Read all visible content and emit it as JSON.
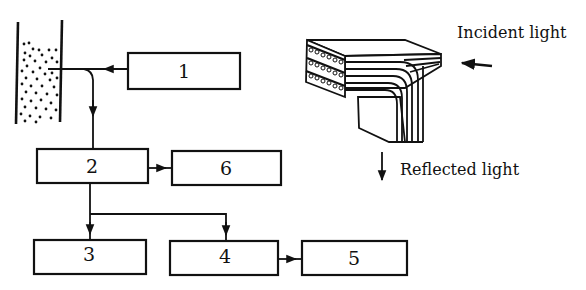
{
  "diagram": {
    "boxes": [
      {
        "id": "1",
        "label": "1"
      },
      {
        "id": "2",
        "label": "2"
      },
      {
        "id": "3",
        "label": "3"
      },
      {
        "id": "4",
        "label": "4"
      },
      {
        "id": "5",
        "label": "5"
      },
      {
        "id": "6",
        "label": "6"
      }
    ],
    "connections": [
      {
        "from": "1",
        "to": "sample-container",
        "note": "fiber into sample"
      },
      {
        "from": "sample-container",
        "to": "2"
      },
      {
        "from": "2",
        "to": "6"
      },
      {
        "from": "2",
        "to": "3"
      },
      {
        "from": "2",
        "to": "4"
      },
      {
        "from": "4",
        "to": "5"
      }
    ],
    "labels": {
      "incident": "Incident light",
      "reflected": "Reflected light"
    },
    "colors": {
      "ink": "#111111",
      "background": "#ffffff"
    }
  }
}
